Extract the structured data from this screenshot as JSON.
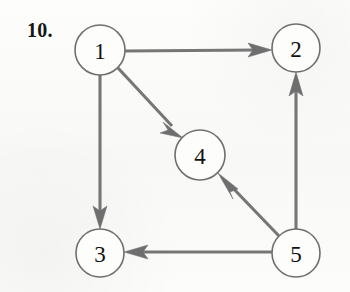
{
  "figure": {
    "problem_number": "10.",
    "kind": "directed-graph",
    "background_color": "#fbfbfa",
    "edge_color": "#767676",
    "node_stroke_color": "#6f6f70",
    "node_fill_color": "#fdfdfc",
    "label_color": "#111111"
  },
  "graph": {
    "nodes": [
      {
        "id": "1",
        "label": "1",
        "cx": 100,
        "cy": 50,
        "r": 25
      },
      {
        "id": "2",
        "label": "2",
        "cx": 296,
        "cy": 48,
        "r": 24
      },
      {
        "id": "4",
        "label": "4",
        "cx": 200,
        "cy": 155,
        "r": 25
      },
      {
        "id": "3",
        "label": "3",
        "cx": 100,
        "cy": 253,
        "r": 24
      },
      {
        "id": "5",
        "label": "5",
        "cx": 296,
        "cy": 253,
        "r": 24
      }
    ],
    "edges": [
      {
        "from": "1",
        "to": "2",
        "directed": true,
        "x1": 125,
        "y1": 51,
        "x2": 272,
        "y2": 50
      },
      {
        "from": "1",
        "to": "4",
        "directed": true,
        "x1": 118,
        "y1": 68,
        "x2": 183,
        "y2": 138
      },
      {
        "from": "1",
        "to": "3",
        "directed": true,
        "x1": 100,
        "y1": 75,
        "x2": 100,
        "y2": 229
      },
      {
        "from": "5",
        "to": "2",
        "directed": true,
        "x1": 296,
        "y1": 229,
        "x2": 296,
        "y2": 72
      },
      {
        "from": "5",
        "to": "4",
        "directed": true,
        "x1": 279,
        "y1": 236,
        "x2": 218,
        "y2": 173
      },
      {
        "from": "5",
        "to": "3",
        "directed": true,
        "x1": 272,
        "y1": 252,
        "x2": 124,
        "y2": 252
      }
    ],
    "edge_list_text": [
      "1 -> 2",
      "1 -> 4",
      "1 -> 3",
      "5 -> 2",
      "5 -> 4",
      "5 -> 3"
    ]
  }
}
